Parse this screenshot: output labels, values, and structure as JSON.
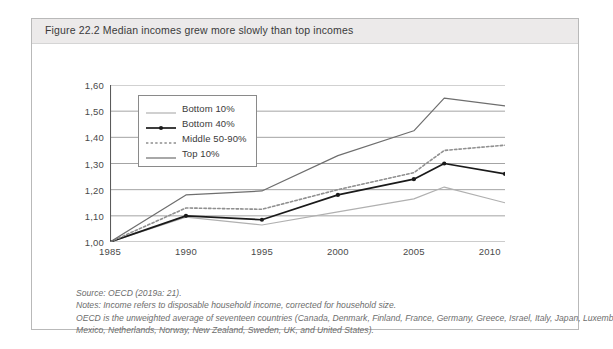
{
  "figure": {
    "number": "Figure 22.2",
    "title": "Figure 22.2  Median incomes grew more slowly than top incomes"
  },
  "notes": {
    "source": "Source: OECD (2019a: 21).",
    "note_1": "Notes: Income refers to disposable household income, corrected for household size.",
    "note_2": "OECD is the unweighted average of seventeen countries (Canada, Denmark, Finland, France, Germany, Greece, Israel, Italy, Japan, Luxembourg,",
    "note_3": "Mexico, Netherlands, Norway, New Zealand, Sweden, UK, and United States)."
  },
  "colors": {
    "bottom10": "#b0b0b0",
    "bottom40": "#1a1a1a",
    "middle": "#8f8f8f",
    "top10": "#6e6e6e",
    "gridline": "#9a9a9a",
    "axis": "#5a5a5a",
    "title_bar": "#eceaea",
    "frame": "#b9b9b9"
  },
  "chart_data": {
    "type": "line",
    "title": "Median incomes grew more slowly than top incomes",
    "xlabel": "",
    "ylabel": "",
    "xlim": [
      1985,
      2011
    ],
    "ylim": [
      1.0,
      1.6
    ],
    "grid": true,
    "legend_position": "upper-left-inside",
    "x_ticks": [
      "1985",
      "1990",
      "1995",
      "2000",
      "2005",
      "2010"
    ],
    "x_tick_values": [
      1985,
      1990,
      1995,
      2000,
      2005,
      2010
    ],
    "y_ticks": [
      "1,00",
      "1,10",
      "1,20",
      "1,30",
      "1,40",
      "1,50",
      "1,60"
    ],
    "y_tick_values": [
      1.0,
      1.1,
      1.2,
      1.3,
      1.4,
      1.5,
      1.6
    ],
    "x": [
      1985,
      1990,
      1995,
      2000,
      2005,
      2007,
      2011
    ],
    "series": [
      {
        "name": "Bottom 10%",
        "key": "bottom10",
        "style": "solid",
        "markers": false,
        "color": "#b0b0b0",
        "values": [
          1.0,
          1.095,
          1.065,
          1.115,
          1.165,
          1.21,
          1.15
        ]
      },
      {
        "name": "Bottom 40%",
        "key": "bottom40",
        "style": "solid",
        "markers": true,
        "color": "#1a1a1a",
        "values": [
          1.0,
          1.1,
          1.085,
          1.18,
          1.24,
          1.3,
          1.26
        ]
      },
      {
        "name": "Middle 50-90%",
        "key": "middle",
        "style": "dotted",
        "markers": false,
        "color": "#8f8f8f",
        "values": [
          1.0,
          1.13,
          1.125,
          1.2,
          1.265,
          1.35,
          1.37
        ]
      },
      {
        "name": "Top 10%",
        "key": "top10",
        "style": "solid",
        "markers": false,
        "color": "#6e6e6e",
        "values": [
          1.0,
          1.18,
          1.195,
          1.33,
          1.425,
          1.55,
          1.52
        ]
      }
    ]
  }
}
